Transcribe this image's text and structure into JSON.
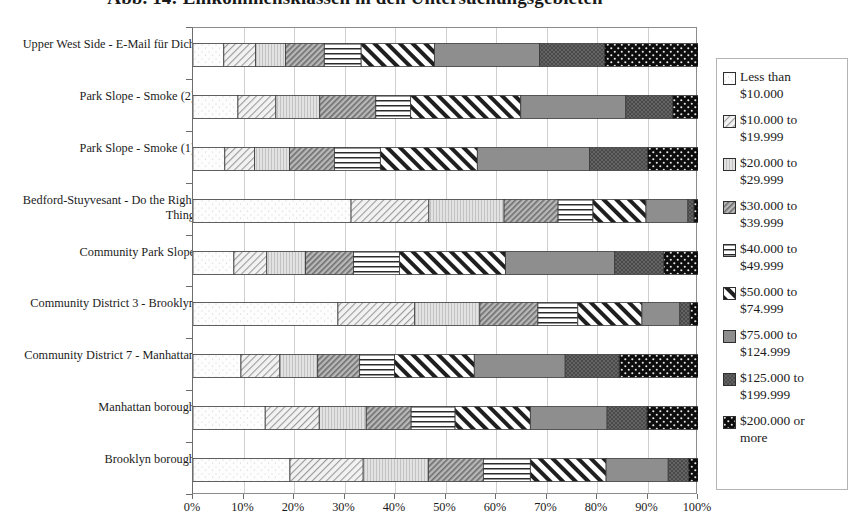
{
  "chart": {
    "title": "Abb. 14: Einkommensklassen in den Untersuchungsgebieten",
    "x_axis": {
      "ticks": [
        "0%",
        "10%",
        "20%",
        "30%",
        "40%",
        "50%",
        "60%",
        "70%",
        "80%",
        "90%",
        "100%"
      ]
    },
    "legend": {
      "items": [
        {
          "label": "Less than\n$10.000",
          "pattern": "blank-white"
        },
        {
          "label": "$10.000 to\n$19.999",
          "pattern": "diagonal-hatch-light"
        },
        {
          "label": "$20.000 to\n$29.999",
          "pattern": "vertical-fine-grey"
        },
        {
          "label": "$30.000 to\n$39.999",
          "pattern": "diagonal-hatch-dense"
        },
        {
          "label": "$40.000 to\n$49.999",
          "pattern": "horizontal-lines"
        },
        {
          "label": "$50.000 to\n$74.999",
          "pattern": "diagonal-wide-backslash"
        },
        {
          "label": "$75.000 to\n$124.999",
          "pattern": "solid-grey"
        },
        {
          "label": "$125.000 to\n$199.999",
          "pattern": "dark-grey-speckle"
        },
        {
          "label": "$200.000 or\nmore",
          "pattern": "black-dots"
        }
      ]
    }
  },
  "chart_data": {
    "type": "bar",
    "orientation": "horizontal",
    "stacked": true,
    "normalized": true,
    "title": "Abb. 14: Einkommensklassen in den Untersuchungsgebieten",
    "xlabel": "",
    "ylabel": "",
    "xlim": [
      0,
      100
    ],
    "grid": true,
    "legend_position": "right",
    "categories": [
      "Upper West Side - E-Mail für Dich",
      "Park Slope - Smoke (2)",
      "Park Slope - Smoke (1)",
      "Bedford-Stuyvesant - Do the Right Thing",
      "Community Park Slope",
      "Community District 3 - Brooklyn",
      "Community District 7 - Manhattan",
      "Manhattan borough",
      "Brooklyn borough"
    ],
    "series": [
      {
        "name": "Less than $10.000",
        "values": [
          6.1,
          8.9,
          6.3,
          31.3,
          8.1,
          28.7,
          9.5,
          14.3,
          19.2
        ]
      },
      {
        "name": "$10.000 to $19.999",
        "values": [
          6.3,
          7.5,
          5.9,
          15.4,
          6.5,
          15.2,
          7.7,
          10.7,
          14.5
        ]
      },
      {
        "name": "$20.000 to $29.999",
        "values": [
          5.9,
          8.7,
          6.9,
          14.9,
          7.7,
          12.9,
          7.5,
          9.3,
          12.9
        ]
      },
      {
        "name": "$30.000 to $39.999",
        "values": [
          7.7,
          11.1,
          8.9,
          10.7,
          9.5,
          11.5,
          8.3,
          8.9,
          10.9
        ]
      },
      {
        "name": "$40.000 to $49.999",
        "values": [
          7.3,
          6.9,
          9.1,
          6.9,
          9.1,
          7.9,
          6.9,
          8.7,
          9.3
        ]
      },
      {
        "name": "$50.000 to $74.999",
        "values": [
          14.5,
          21.8,
          19.2,
          10.5,
          21.0,
          12.7,
          15.8,
          14.9,
          15.0
        ]
      },
      {
        "name": "$75.000 to $124.999",
        "values": [
          20.8,
          20.8,
          22.2,
          8.3,
          21.6,
          7.5,
          18.0,
          15.2,
          12.3
        ]
      },
      {
        "name": "$125.000 to $199.999",
        "values": [
          12.9,
          9.3,
          11.5,
          1.2,
          9.7,
          2.0,
          10.7,
          7.9,
          4.0
        ]
      },
      {
        "name": "$200.000 or more",
        "values": [
          19.2,
          5.7,
          10.7,
          1.2,
          7.5,
          2.4,
          16.2,
          10.9,
          2.8
        ]
      }
    ]
  }
}
